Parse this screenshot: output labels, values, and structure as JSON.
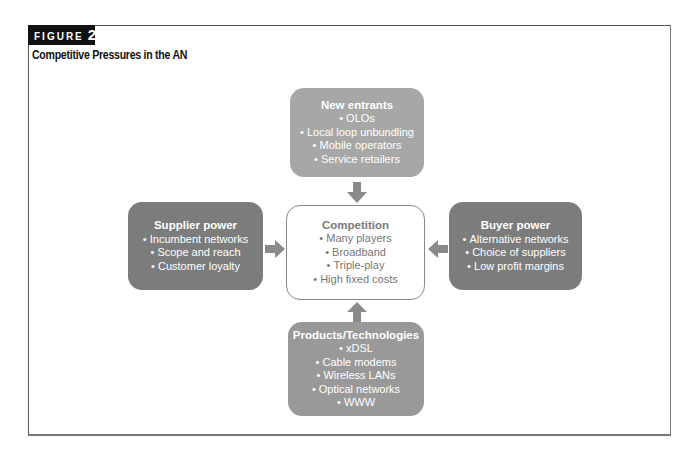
{
  "figure": {
    "label": "FIGURE",
    "number": "2",
    "title": "Competitive Pressures in the AN"
  },
  "diagram": {
    "center": {
      "title": "Competition",
      "items": [
        "Many players",
        "Broadband",
        "Triple-play",
        "High fixed costs"
      ]
    },
    "top": {
      "title": "New entrants",
      "items": [
        "OLOs",
        "Local loop unbundling",
        "Mobile operators",
        "Service retailers"
      ]
    },
    "left": {
      "title": "Supplier power",
      "items": [
        "Incumbent networks",
        "Scope and reach",
        "Customer loyalty"
      ]
    },
    "right": {
      "title": "Buyer power",
      "items": [
        "Alternative networks",
        "Choice of suppliers",
        "Low profit margins"
      ]
    },
    "bottom": {
      "title": "Products/Technologies",
      "items": [
        "xDSL",
        "Cable modems",
        "Wireless LANs",
        "Optical networks",
        "WWW"
      ]
    },
    "colors": {
      "top_box": "#a7a7a7",
      "side_boxes": "#7c7c7c",
      "bottom_box": "#999999",
      "center_border": "#888888",
      "arrows": "#8a8a8a"
    },
    "arrows": [
      {
        "from": "top",
        "to": "center",
        "direction": "down"
      },
      {
        "from": "left",
        "to": "center",
        "direction": "right"
      },
      {
        "from": "right",
        "to": "center",
        "direction": "left"
      },
      {
        "from": "bottom",
        "to": "center",
        "direction": "up"
      }
    ]
  }
}
